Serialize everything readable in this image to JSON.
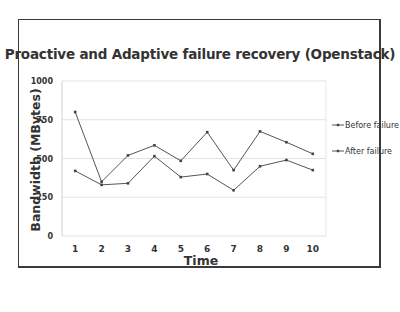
{
  "chart_data": {
    "type": "line",
    "title": "Proactive and Adaptive failure recovery (Openstack)",
    "xlabel": "Time",
    "ylabel": "Bandwidth (MBytes)",
    "x": [
      1,
      2,
      3,
      4,
      5,
      6,
      7,
      8,
      9,
      10
    ],
    "categories": [
      "1",
      "2",
      "3",
      "4",
      "5",
      "6",
      "7",
      "8",
      "9",
      "10"
    ],
    "yticks": [
      0,
      250,
      500,
      750,
      1000
    ],
    "ylim": [
      0,
      1000
    ],
    "grid": true,
    "legend_position": "right",
    "series": [
      {
        "name": "Before failure",
        "values": [
          800,
          350,
          520,
          585,
          485,
          670,
          425,
          675,
          605,
          530
        ],
        "color": "#555555",
        "marker": "diamond"
      },
      {
        "name": "After failure",
        "values": [
          420,
          330,
          340,
          515,
          380,
          400,
          295,
          450,
          490,
          425
        ],
        "color": "#555555",
        "marker": "triangle"
      }
    ]
  },
  "colors": {
    "line": "#555555",
    "grid": "#e3e3e3",
    "text": "#333333",
    "frame": "#3a3a3a"
  }
}
